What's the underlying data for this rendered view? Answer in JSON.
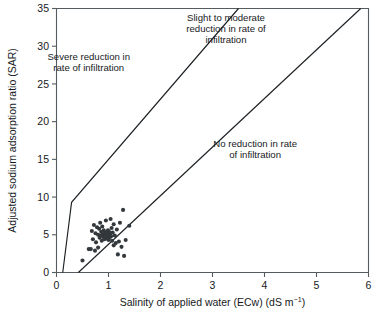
{
  "chart_data": {
    "type": "scatter",
    "title": "",
    "xlabel": "Salinity of applied water (ECw) (dS m",
    "xlabel_sup": "−1",
    "xlabel_tail": ")",
    "ylabel": "Adjusted sodium adsorption ratio (SAR)",
    "xlim": [
      0,
      6
    ],
    "ylim": [
      0,
      35
    ],
    "xticks": [
      "0",
      "1",
      "2",
      "3",
      "4",
      "5",
      "6"
    ],
    "xtick_values": [
      0,
      1,
      2,
      3,
      4,
      5,
      6
    ],
    "yticks": [
      "0",
      "5",
      "10",
      "15",
      "20",
      "25",
      "30",
      "35"
    ],
    "ytick_values": [
      0,
      5,
      10,
      15,
      20,
      25,
      30,
      35
    ],
    "grid": false,
    "legend": "none",
    "marker": "filled-circle",
    "marker_color": "#33383c",
    "line_color": "#1d2124",
    "annotations": [
      {
        "name": "severe-reduction",
        "lines": [
          "Severe reduction in",
          "rate of infiltration"
        ],
        "x": 0.62,
        "y": 28.2
      },
      {
        "name": "slight-moderate-reduction",
        "lines": [
          "Slight to moderate",
          "reduction in rate of",
          "infiltration"
        ],
        "x": 3.26,
        "y": 33.4
      },
      {
        "name": "no-reduction",
        "lines": [
          "No reduction in rate",
          "of infiltration"
        ],
        "x": 3.82,
        "y": 16.6
      }
    ],
    "boundaries": [
      {
        "name": "severe-slight-boundary",
        "points": [
          [
            0.12,
            0.0
          ],
          [
            0.29,
            9.3
          ],
          [
            3.5,
            35.0
          ]
        ]
      },
      {
        "name": "slight-none-boundary",
        "points": [
          [
            0.42,
            0.0
          ],
          [
            5.85,
            35.0
          ]
        ]
      }
    ],
    "points": [
      [
        0.5,
        1.6
      ],
      [
        0.62,
        3.1
      ],
      [
        0.66,
        3.1
      ],
      [
        0.68,
        5.5
      ],
      [
        0.7,
        4.4
      ],
      [
        0.72,
        6.3
      ],
      [
        0.74,
        2.9
      ],
      [
        0.75,
        5.2
      ],
      [
        0.76,
        4.0
      ],
      [
        0.78,
        6.0
      ],
      [
        0.8,
        5.0
      ],
      [
        0.8,
        3.3
      ],
      [
        0.82,
        5.8
      ],
      [
        0.83,
        4.6
      ],
      [
        0.84,
        6.6
      ],
      [
        0.85,
        4.9
      ],
      [
        0.86,
        5.4
      ],
      [
        0.87,
        4.2
      ],
      [
        0.88,
        6.1
      ],
      [
        0.89,
        5.1
      ],
      [
        0.9,
        4.7
      ],
      [
        0.91,
        5.6
      ],
      [
        0.92,
        4.4
      ],
      [
        0.93,
        5.0
      ],
      [
        0.94,
        5.3
      ],
      [
        0.95,
        4.8
      ],
      [
        0.95,
        6.9
      ],
      [
        0.96,
        4.5
      ],
      [
        0.97,
        5.2
      ],
      [
        0.98,
        4.9
      ],
      [
        0.99,
        5.6
      ],
      [
        1.0,
        4.3
      ],
      [
        1.0,
        5.0
      ],
      [
        1.01,
        5.4
      ],
      [
        1.02,
        4.6
      ],
      [
        1.03,
        5.1
      ],
      [
        1.04,
        7.1
      ],
      [
        1.05,
        4.8
      ],
      [
        1.06,
        5.9
      ],
      [
        1.07,
        4.2
      ],
      [
        1.08,
        5.3
      ],
      [
        1.1,
        6.4
      ],
      [
        1.1,
        3.6
      ],
      [
        1.12,
        4.9
      ],
      [
        1.14,
        3.9
      ],
      [
        1.16,
        5.7
      ],
      [
        1.18,
        2.4
      ],
      [
        1.2,
        4.1
      ],
      [
        1.22,
        6.6
      ],
      [
        1.25,
        3.4
      ],
      [
        1.28,
        8.3
      ],
      [
        1.3,
        2.2
      ],
      [
        1.33,
        4.3
      ],
      [
        1.4,
        6.2
      ]
    ]
  }
}
